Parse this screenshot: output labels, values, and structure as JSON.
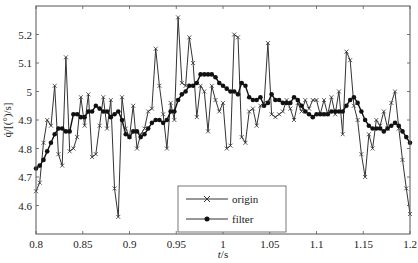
{
  "chart_data": {
    "type": "line",
    "title": "",
    "xlabel": "t/s",
    "ylabel": "q̇/[(°)/s]",
    "xlim": [
      0.8,
      1.2
    ],
    "ylim": [
      4.5,
      5.3
    ],
    "xticks": [
      "0.8",
      "0.85",
      "0.9",
      "0.95",
      "1",
      "1.05",
      "1.1",
      "1.15",
      "1.2"
    ],
    "yticks": [
      "4.6",
      "4.7",
      "4.8",
      "4.9",
      "5",
      "5.1",
      "5.2"
    ],
    "grid": false,
    "legend_position": "lower center",
    "x": [
      0.8,
      0.804,
      0.808,
      0.812,
      0.816,
      0.82,
      0.824,
      0.828,
      0.832,
      0.836,
      0.84,
      0.844,
      0.848,
      0.852,
      0.856,
      0.86,
      0.864,
      0.868,
      0.872,
      0.876,
      0.88,
      0.884,
      0.888,
      0.892,
      0.896,
      0.9,
      0.904,
      0.908,
      0.912,
      0.916,
      0.92,
      0.924,
      0.928,
      0.932,
      0.936,
      0.94,
      0.944,
      0.948,
      0.952,
      0.956,
      0.96,
      0.964,
      0.968,
      0.972,
      0.976,
      0.98,
      0.984,
      0.988,
      0.992,
      0.996,
      1.0,
      1.004,
      1.008,
      1.012,
      1.016,
      1.02,
      1.024,
      1.028,
      1.032,
      1.036,
      1.04,
      1.044,
      1.048,
      1.052,
      1.056,
      1.06,
      1.064,
      1.068,
      1.072,
      1.076,
      1.08,
      1.084,
      1.088,
      1.092,
      1.096,
      1.1,
      1.104,
      1.108,
      1.112,
      1.116,
      1.12,
      1.124,
      1.128,
      1.132,
      1.136,
      1.14,
      1.144,
      1.148,
      1.152,
      1.156,
      1.16,
      1.164,
      1.168,
      1.172,
      1.176,
      1.18,
      1.184,
      1.188,
      1.192,
      1.196,
      1.2
    ],
    "series": [
      {
        "name": "origin",
        "marker": "x",
        "values": [
          4.65,
          4.68,
          4.82,
          4.9,
          4.88,
          5.02,
          4.78,
          4.74,
          5.12,
          4.79,
          4.8,
          4.84,
          4.98,
          4.88,
          4.99,
          4.77,
          4.78,
          4.88,
          4.98,
          4.87,
          4.97,
          4.66,
          4.56,
          4.98,
          4.87,
          4.84,
          4.95,
          4.8,
          4.85,
          4.87,
          4.93,
          4.94,
          5.15,
          5.02,
          4.92,
          4.8,
          4.96,
          4.9,
          5.26,
          5.03,
          5.02,
          5.19,
          5.1,
          4.91,
          5.02,
          5.0,
          4.86,
          5.02,
          4.97,
          4.93,
          4.96,
          4.8,
          4.81,
          5.2,
          5.19,
          4.84,
          4.82,
          4.93,
          4.94,
          4.88,
          4.95,
          4.96,
          5.17,
          4.92,
          4.91,
          4.92,
          4.93,
          4.97,
          4.94,
          4.9,
          4.96,
          4.93,
          4.97,
          4.94,
          4.97,
          4.97,
          4.92,
          4.97,
          4.92,
          4.98,
          4.92,
          5.0,
          4.85,
          5.14,
          5.11,
          4.95,
          4.9,
          4.78,
          4.7,
          4.85,
          4.8,
          4.9,
          4.88,
          4.93,
          4.87,
          4.96,
          5.0,
          4.87,
          4.76,
          4.66,
          4.57
        ]
      },
      {
        "name": "filter",
        "marker": "o",
        "values": [
          4.73,
          4.74,
          4.76,
          4.79,
          4.82,
          4.85,
          4.87,
          4.87,
          4.86,
          4.86,
          4.92,
          4.92,
          4.91,
          4.91,
          4.93,
          4.93,
          4.95,
          4.94,
          4.93,
          4.93,
          4.91,
          4.92,
          4.93,
          4.9,
          4.85,
          4.84,
          4.86,
          4.86,
          4.84,
          4.85,
          4.87,
          4.89,
          4.9,
          4.9,
          4.89,
          4.9,
          4.93,
          4.93,
          4.97,
          4.99,
          5.0,
          5.02,
          5.02,
          5.03,
          5.06,
          5.06,
          5.06,
          5.06,
          5.05,
          5.03,
          5.02,
          5.01,
          5.0,
          5.0,
          4.99,
          5.03,
          5.02,
          4.98,
          4.97,
          4.97,
          4.98,
          4.95,
          4.96,
          4.99,
          4.97,
          4.97,
          4.96,
          4.96,
          4.96,
          4.98,
          4.97,
          4.95,
          4.93,
          4.92,
          4.91,
          4.92,
          4.92,
          4.92,
          4.92,
          4.93,
          4.93,
          4.93,
          4.93,
          4.95,
          4.97,
          4.98,
          4.96,
          4.93,
          4.9,
          4.88,
          4.87,
          4.87,
          4.87,
          4.86,
          4.87,
          4.88,
          4.89,
          4.88,
          4.86,
          4.84,
          4.82
        ]
      }
    ]
  },
  "legend": {
    "items": [
      {
        "label": "origin"
      },
      {
        "label": "filter"
      }
    ]
  },
  "axes": {
    "xlabel_italic": "t",
    "xlabel_unit": "/s",
    "ylabel": "q̇/[(°)/s]"
  }
}
